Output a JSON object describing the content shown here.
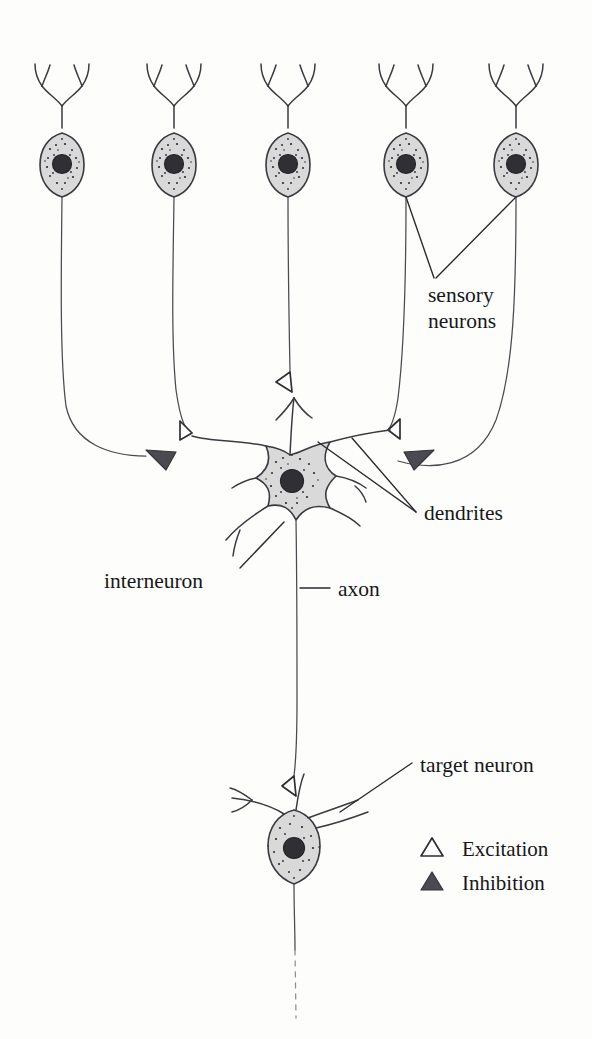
{
  "figure": {
    "labels": {
      "sensory_line1": "sensory",
      "sensory_line2": "neurons",
      "dendrites": "dendrites",
      "interneuron": "interneuron",
      "axon": "axon",
      "target_neuron": "target neuron"
    },
    "legend": {
      "items": [
        {
          "symbol": "open-triangle",
          "label": "Excitation"
        },
        {
          "symbol": "filled-triangle",
          "label": "Inhibition"
        }
      ]
    },
    "colors": {
      "ink": "#3a3a40",
      "soma_fill": "#d9d9d9",
      "nucleus": "#2f2f34",
      "inhibition_fill": "#4a4a50",
      "excitation_fill": "#ffffff",
      "background": "#fdfdfc"
    },
    "cells": {
      "sensory_neuron_count": 5,
      "interneuron_count": 1,
      "target_neuron_count": 1
    },
    "synapses": {
      "excitatory_count": 4,
      "inhibitory_count": 2
    }
  }
}
